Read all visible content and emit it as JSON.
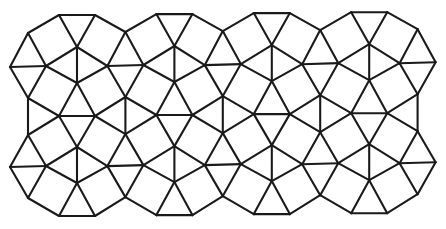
{
  "figure": {
    "title": "Square-triangle tiling with dodecagonal units",
    "columns": 4,
    "rows": 2,
    "tile_types": [
      "equilateral-triangle",
      "square"
    ],
    "colors": {
      "background": "#ffffff",
      "line": "#1a1a1a"
    }
  }
}
